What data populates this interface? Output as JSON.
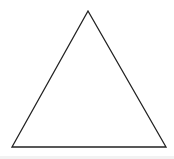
{
  "diagram": {
    "shape": "triangle",
    "type": "equilateral",
    "vertices": [
      [
        88,
        11
      ],
      [
        12,
        147
      ],
      [
        166,
        147
      ]
    ],
    "stroke_color": "#222222",
    "fill_color": "#ffffff",
    "stroke_width": 1.3
  },
  "colors": {
    "background": "#ffffff",
    "bottom_strip": "#f2f2f2"
  }
}
